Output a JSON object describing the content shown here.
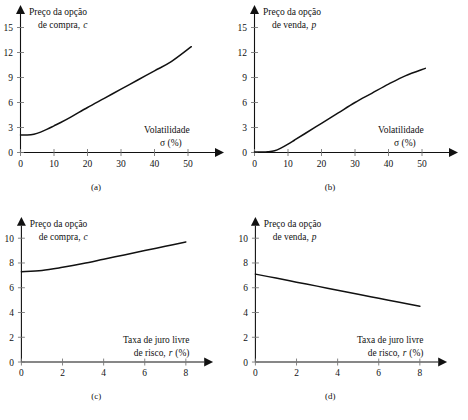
{
  "figure": {
    "background": "#ffffff",
    "ink": "#111111",
    "panel_count": 4
  },
  "panels": [
    {
      "key": "a",
      "caption": "(a)",
      "ylabel_line1": "Preço da opção",
      "ylabel_line2": "de compra,",
      "ylabel_symbol": "c",
      "xlabel_line1": "Volatilidade",
      "xlabel_line2": "σ (%)",
      "yticks": [
        "0",
        "3",
        "6",
        "9",
        "12",
        "15"
      ],
      "xticks": [
        "0",
        "10",
        "20",
        "30",
        "40",
        "50"
      ]
    },
    {
      "key": "b",
      "caption": "(b)",
      "ylabel_line1": "Preço da opção",
      "ylabel_line2": "de venda,",
      "ylabel_symbol": "p",
      "xlabel_line1": "Volatilidade",
      "xlabel_line2": "σ (%)",
      "yticks": [
        "0",
        "3",
        "6",
        "9",
        "12",
        "15"
      ],
      "xticks": [
        "0",
        "10",
        "20",
        "30",
        "40",
        "50"
      ]
    },
    {
      "key": "c",
      "caption": "(c)",
      "ylabel_line1": "Preço da opção",
      "ylabel_line2": "de compra,",
      "ylabel_symbol": "c",
      "xlabel_line1": "Taxa de juro livre",
      "xlabel_line2": "de risco,",
      "xlabel_symbol": "r",
      "xlabel_unit": "(%)",
      "yticks": [
        "0",
        "2",
        "4",
        "6",
        "8",
        "10"
      ],
      "xticks": [
        "0",
        "2",
        "4",
        "6",
        "8"
      ]
    },
    {
      "key": "d",
      "caption": "(d)",
      "ylabel_line1": "Preço da opção",
      "ylabel_line2": "de venda,",
      "ylabel_symbol": "p",
      "xlabel_line1": "Taxa de juro livre",
      "xlabel_line2": "de risco,",
      "xlabel_symbol": "r",
      "xlabel_unit": "(%)",
      "yticks": [
        "0",
        "2",
        "4",
        "6",
        "8",
        "10"
      ],
      "xticks": [
        "0",
        "2",
        "4",
        "6",
        "8"
      ]
    }
  ],
  "chart_data": [
    {
      "type": "line",
      "id": "a",
      "title": "Preço da opção de compra, c",
      "xlabel": "Volatilidade σ (%)",
      "ylabel": "Preço da opção de compra, c",
      "xlim": [
        0,
        56
      ],
      "ylim": [
        0,
        16.5
      ],
      "xticks": [
        0,
        10,
        20,
        30,
        40,
        50
      ],
      "yticks": [
        0,
        3,
        6,
        9,
        12,
        15
      ],
      "grid": false,
      "legend": null,
      "x": [
        0,
        2,
        4,
        6,
        8,
        10,
        12,
        15,
        20,
        25,
        30,
        35,
        40,
        45,
        51
      ],
      "y": [
        2.1,
        2.1,
        2.2,
        2.45,
        2.8,
        3.2,
        3.6,
        4.25,
        5.4,
        6.5,
        7.6,
        8.7,
        9.8,
        10.9,
        12.7
      ]
    },
    {
      "type": "line",
      "id": "b",
      "title": "Preço da opção de venda, p",
      "xlabel": "Volatilidade σ (%)",
      "ylabel": "Preço da opção de venda, p",
      "xlim": [
        0,
        56
      ],
      "ylim": [
        0,
        16.5
      ],
      "xticks": [
        0,
        10,
        20,
        30,
        40,
        50
      ],
      "yticks": [
        0,
        3,
        6,
        9,
        12,
        15
      ],
      "grid": false,
      "legend": null,
      "x": [
        0,
        2,
        4,
        6,
        8,
        10,
        12,
        15,
        20,
        25,
        30,
        35,
        40,
        45,
        51
      ],
      "y": [
        0.05,
        0.05,
        0.08,
        0.2,
        0.55,
        1.0,
        1.5,
        2.25,
        3.5,
        4.75,
        6.0,
        7.1,
        8.2,
        9.2,
        10.1
      ]
    },
    {
      "type": "line",
      "id": "c",
      "title": "Preço da opção de compra, c",
      "xlabel": "Taxa de juro livre de risco, r (%)",
      "ylabel": "Preço da opção de compra, c",
      "xlim": [
        0,
        9
      ],
      "ylim": [
        0,
        11.5
      ],
      "xticks": [
        0,
        2,
        4,
        6,
        8
      ],
      "yticks": [
        0,
        2,
        4,
        6,
        8,
        10
      ],
      "grid": false,
      "legend": null,
      "x": [
        0,
        1,
        2,
        3,
        4,
        5,
        6,
        7,
        8
      ],
      "y": [
        7.3,
        7.4,
        7.65,
        7.95,
        8.3,
        8.65,
        9.0,
        9.35,
        9.7
      ]
    },
    {
      "type": "line",
      "id": "d",
      "title": "Preço da opção de venda, p",
      "xlabel": "Taxa de juro livre de risco, r (%)",
      "ylabel": "Preço da opção de venda, p",
      "xlim": [
        0,
        9
      ],
      "ylim": [
        0,
        11.5
      ],
      "xticks": [
        0,
        2,
        4,
        6,
        8
      ],
      "yticks": [
        0,
        2,
        4,
        6,
        8,
        10
      ],
      "grid": false,
      "legend": null,
      "x": [
        0,
        1,
        2,
        3,
        4,
        5,
        6,
        7,
        8
      ],
      "y": [
        7.1,
        6.78,
        6.45,
        6.13,
        5.8,
        5.48,
        5.15,
        4.83,
        4.5
      ]
    }
  ]
}
